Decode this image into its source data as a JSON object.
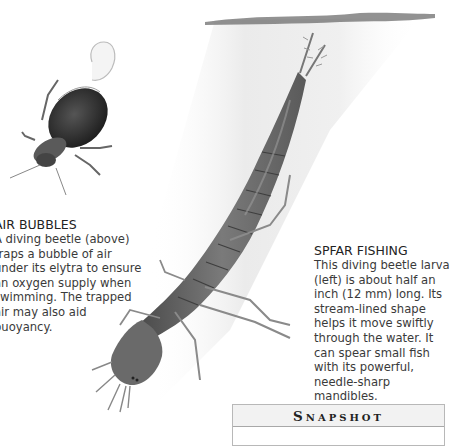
{
  "captions": {
    "air_bubbles": {
      "heading": "AIR BUBBLES",
      "body": "A diving beetle (above) traps a bubble of air under its elytra to ensure an oxygen supply when swimming. The trapped air may also aid buoyancy."
    },
    "spear_fishing": {
      "heading": "SPFAR FISHING",
      "body": "This diving beetle larva (left) is about half an inch (12 mm) long. Its stream-lined shape helps it move swiftly through the water. It can spear small fish with its powerful, needle-sharp mandibles."
    }
  },
  "snapshot": {
    "first_letter": "S",
    "rest": "NAPSHOT"
  },
  "illustrations": {
    "beetle": "diving-beetle-with-air-bubble",
    "larva": "diving-beetle-larva",
    "water_surface": "water-surface"
  },
  "colors": {
    "text": "#3a3a3a",
    "beetle_dark": "#2b2b2b",
    "larva_body": "#6e6e6e",
    "water_shade": "#e8e8e8"
  }
}
